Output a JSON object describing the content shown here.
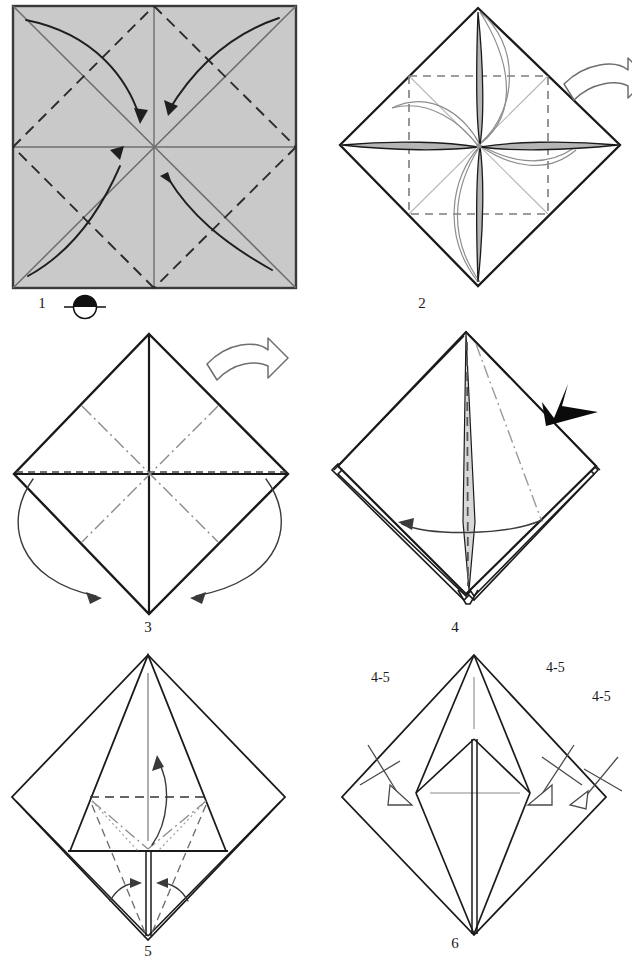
{
  "document": {
    "kind": "origami-folding-diagram",
    "title": "Origami folding sequence, steps 1-6",
    "page_width": 632,
    "page_height": 964
  },
  "colors": {
    "paper_gray": "#c9c9c9",
    "paper_white": "#ffffff",
    "ink": "#1a1a1a",
    "ink_soft": "#555555",
    "ink_light": "#8a8a8a",
    "border": "#3a3a3a",
    "star_fill": "#b5b5b5",
    "arrow_hollow_stroke": "#6f6f6f"
  },
  "steps": [
    {
      "id": "step-1",
      "number": "1",
      "caption_number": "1",
      "shape": "square",
      "paper_side": "colored",
      "symbols": [
        "turn-over-symbol",
        "four-curved-arrows"
      ],
      "fold_lines": [
        "solid-diagonals",
        "dashed-rotated-square",
        "solid-midlines"
      ]
    },
    {
      "id": "step-2",
      "number": "2",
      "caption_number": "2",
      "shape": "diamond",
      "paper_side": "white",
      "symbols": [
        "hollow-turn-over-arrow",
        "four-point-star",
        "curved-guides"
      ],
      "fold_lines": [
        "dashed-inner-square",
        "light-diagonals"
      ]
    },
    {
      "id": "step-3",
      "number": "3",
      "caption_number": "3",
      "shape": "diamond",
      "paper_side": "white",
      "symbols": [
        "hollow-turn-over-arrow",
        "two-wrap-arrows"
      ],
      "fold_lines": [
        "solid-midlines",
        "dash-dot-inner-square"
      ]
    },
    {
      "id": "step-4",
      "number": "4",
      "caption_number": "4",
      "shape": "diamond-layered",
      "paper_side": "white",
      "symbols": [
        "solid-push-arrowhead",
        "horizontal-swivel-arrow"
      ],
      "fold_lines": [
        "dashed-center",
        "dash-dot-diagonal"
      ]
    },
    {
      "id": "step-5",
      "number": "5",
      "caption_number": "5",
      "shape": "diamond-with-inner-triangle",
      "paper_side": "white",
      "symbols": [
        "up-arrow",
        "two-inward-arrows"
      ],
      "fold_lines": [
        "dashed-horizontal",
        "dash-dot-v",
        "dotted-guides",
        "dashed-lower-v"
      ]
    },
    {
      "id": "step-6",
      "number": "6",
      "caption_number": "6",
      "shape": "diamond-with-kite",
      "paper_side": "white",
      "symbols": [
        "repeat-arrow-left",
        "repeat-arrow-right-inner",
        "repeat-arrow-right-outer"
      ],
      "fold_lines": [
        "solid-kite",
        "light-center-cross"
      ]
    }
  ],
  "repeat_labels": [
    {
      "id": "repeat-label-left",
      "text": "4-5",
      "x": 371,
      "y": 671
    },
    {
      "id": "repeat-label-right-inner",
      "text": "4-5",
      "x": 546,
      "y": 661
    },
    {
      "id": "repeat-label-right-outer",
      "text": "4-5",
      "x": 592,
      "y": 690
    }
  ],
  "step_numbers": [
    {
      "id": "step-number-1",
      "text": "1",
      "x": 22,
      "y": 296
    },
    {
      "id": "step-number-2",
      "text": "2",
      "x": 402,
      "y": 296
    },
    {
      "id": "step-number-3",
      "text": "3",
      "x": 128,
      "y": 620
    },
    {
      "id": "step-number-4",
      "text": "4",
      "x": 435,
      "y": 620
    },
    {
      "id": "step-number-5",
      "text": "5",
      "x": 128,
      "y": 944
    },
    {
      "id": "step-number-6",
      "text": "6",
      "x": 435,
      "y": 936
    }
  ]
}
